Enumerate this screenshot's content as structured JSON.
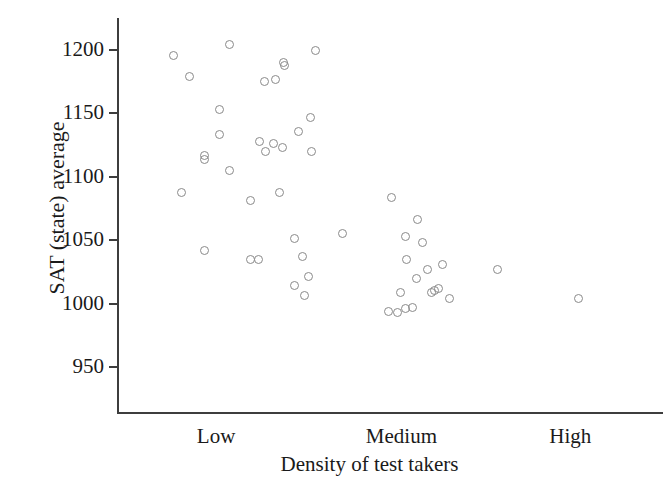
{
  "chart_data": {
    "type": "scatter",
    "title": "",
    "xlabel": "Density of test takers",
    "ylabel": "SAT (state) average",
    "ylim": [
      940,
      1215
    ],
    "yticks": [
      1200,
      1150,
      1100,
      1050,
      1000,
      950
    ],
    "ytick_labels": [
      "1200",
      "1150",
      "1100",
      "1050",
      "1000",
      "950"
    ],
    "xtick_labels": [
      "Low",
      "Medium",
      "High"
    ],
    "xtick_positions": [
      0.18,
      0.52,
      0.83
    ],
    "xlim": [
      0,
      1
    ],
    "grid": false,
    "legend": null,
    "marker": "open-circle",
    "marker_color": "#8a8a8a",
    "points": [
      {
        "x": 0.102,
        "y": 1196
      },
      {
        "x": 0.205,
        "y": 1204
      },
      {
        "x": 0.132,
        "y": 1179
      },
      {
        "x": 0.187,
        "y": 1153
      },
      {
        "x": 0.187,
        "y": 1133
      },
      {
        "x": 0.158,
        "y": 1117
      },
      {
        "x": 0.158,
        "y": 1114
      },
      {
        "x": 0.205,
        "y": 1105
      },
      {
        "x": 0.116,
        "y": 1088
      },
      {
        "x": 0.244,
        "y": 1081
      },
      {
        "x": 0.158,
        "y": 1042
      },
      {
        "x": 0.243,
        "y": 1035
      },
      {
        "x": 0.363,
        "y": 1200
      },
      {
        "x": 0.303,
        "y": 1190
      },
      {
        "x": 0.305,
        "y": 1188
      },
      {
        "x": 0.268,
        "y": 1175
      },
      {
        "x": 0.289,
        "y": 1177
      },
      {
        "x": 0.354,
        "y": 1147
      },
      {
        "x": 0.331,
        "y": 1136
      },
      {
        "x": 0.259,
        "y": 1128
      },
      {
        "x": 0.285,
        "y": 1126
      },
      {
        "x": 0.271,
        "y": 1120
      },
      {
        "x": 0.302,
        "y": 1123
      },
      {
        "x": 0.355,
        "y": 1120
      },
      {
        "x": 0.297,
        "y": 1088
      },
      {
        "x": 0.323,
        "y": 1051
      },
      {
        "x": 0.339,
        "y": 1037
      },
      {
        "x": 0.258,
        "y": 1035
      },
      {
        "x": 0.35,
        "y": 1021
      },
      {
        "x": 0.324,
        "y": 1014
      },
      {
        "x": 0.343,
        "y": 1006
      },
      {
        "x": 0.412,
        "y": 1055
      },
      {
        "x": 0.502,
        "y": 1084
      },
      {
        "x": 0.549,
        "y": 1066
      },
      {
        "x": 0.527,
        "y": 1053
      },
      {
        "x": 0.559,
        "y": 1048
      },
      {
        "x": 0.53,
        "y": 1035
      },
      {
        "x": 0.568,
        "y": 1027
      },
      {
        "x": 0.596,
        "y": 1031
      },
      {
        "x": 0.547,
        "y": 1020
      },
      {
        "x": 0.519,
        "y": 1009
      },
      {
        "x": 0.588,
        "y": 1012
      },
      {
        "x": 0.581,
        "y": 1010
      },
      {
        "x": 0.575,
        "y": 1009
      },
      {
        "x": 0.609,
        "y": 1004
      },
      {
        "x": 0.497,
        "y": 994
      },
      {
        "x": 0.512,
        "y": 993
      },
      {
        "x": 0.527,
        "y": 996
      },
      {
        "x": 0.54,
        "y": 997
      },
      {
        "x": 0.697,
        "y": 1027
      },
      {
        "x": 0.845,
        "y": 1004
      }
    ]
  },
  "axis": {
    "y_title": "SAT (state) average",
    "x_title": "Density of test takers"
  }
}
